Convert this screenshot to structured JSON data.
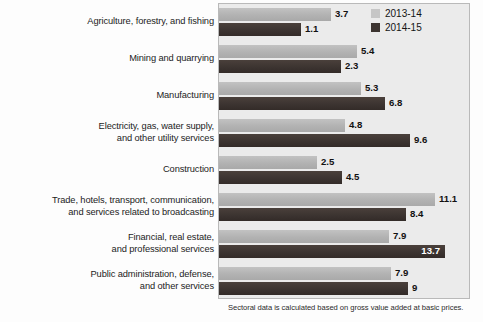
{
  "chart_data": {
    "type": "bar",
    "title": "",
    "subtitle": "",
    "xlabel": "",
    "ylabel": "",
    "orientation": "horizontal",
    "grid": false,
    "legend_position": "top-right",
    "xlim": [
      0,
      14
    ],
    "categories": [
      "Agriculture, forestry, and fishing",
      "Mining and quarrying",
      "Manufacturing",
      "Electricity, gas, water supply,\nand other utility services",
      "Construction",
      "Trade, hotels, transport, communication,\nand services related to broadcasting",
      "Financial, real estate,\nand professional services",
      "Public administration, defense,\nand other services"
    ],
    "series": [
      {
        "name": "2013-14",
        "color": "#b7b7b7",
        "values": [
          3.7,
          5.4,
          5.3,
          4.8,
          2.5,
          11.1,
          7.9,
          7.9
        ],
        "labels": [
          "3.7",
          "5.4",
          "5.3",
          "4.8",
          "2.5",
          "11.1",
          "7.9",
          "7.9"
        ],
        "bar_px": [
          112,
          138,
          142,
          126,
          98,
          216,
          170,
          172
        ],
        "label_inside": [
          false,
          false,
          false,
          false,
          false,
          false,
          false,
          false
        ]
      },
      {
        "name": "2014-15",
        "color": "#3f3632",
        "values": [
          1.1,
          2.3,
          6.8,
          9.6,
          4.5,
          8.4,
          13.7,
          9.0
        ],
        "labels": [
          "1.1",
          "2.3",
          "6.8",
          "9.6",
          "4.5",
          "8.4",
          "13.7",
          "9"
        ],
        "bar_px": [
          82,
          122,
          166,
          191,
          123,
          187,
          226,
          189
        ],
        "label_inside": [
          false,
          false,
          false,
          false,
          false,
          false,
          true,
          false
        ]
      }
    ],
    "annotations": [
      "Sectoral data is calculated based on gross value added at basic prices."
    ]
  },
  "legend": {
    "items": [
      {
        "label": "2013-14",
        "swatch": "s1"
      },
      {
        "label": "2014-15",
        "swatch": "s2"
      }
    ]
  },
  "footnote": {
    "text": "Sectoral data is calculated based on gross value added at basic prices."
  },
  "rows": [
    {
      "label_lines": [
        "Agriculture, forestry, and fishing"
      ],
      "s1": {
        "label": "3.7",
        "px": 112,
        "inside": false
      },
      "s2": {
        "label": "1.1",
        "px": 82,
        "inside": false
      }
    },
    {
      "label_lines": [
        "Mining and quarrying"
      ],
      "s1": {
        "label": "5.4",
        "px": 138,
        "inside": false
      },
      "s2": {
        "label": "2.3",
        "px": 122,
        "inside": false
      }
    },
    {
      "label_lines": [
        "Manufacturing"
      ],
      "s1": {
        "label": "5.3",
        "px": 142,
        "inside": false
      },
      "s2": {
        "label": "6.8",
        "px": 166,
        "inside": false
      }
    },
    {
      "label_lines": [
        "Electricity, gas, water supply,",
        "and other utility services"
      ],
      "s1": {
        "label": "4.8",
        "px": 126,
        "inside": false
      },
      "s2": {
        "label": "9.6",
        "px": 191,
        "inside": false
      }
    },
    {
      "label_lines": [
        "Construction"
      ],
      "s1": {
        "label": "2.5",
        "px": 98,
        "inside": false
      },
      "s2": {
        "label": "4.5",
        "px": 123,
        "inside": false
      }
    },
    {
      "label_lines": [
        "Trade, hotels, transport, communication,",
        "and services related to broadcasting"
      ],
      "s1": {
        "label": "11.1",
        "px": 216,
        "inside": false
      },
      "s2": {
        "label": "8.4",
        "px": 187,
        "inside": false
      }
    },
    {
      "label_lines": [
        "Financial, real estate,",
        "and professional services"
      ],
      "s1": {
        "label": "7.9",
        "px": 170,
        "inside": false
      },
      "s2": {
        "label": "13.7",
        "px": 226,
        "inside": true
      }
    },
    {
      "label_lines": [
        "Public administration, defense,",
        "and other services"
      ],
      "s1": {
        "label": "7.9",
        "px": 172,
        "inside": false
      },
      "s2": {
        "label": "9",
        "px": 189,
        "inside": false
      }
    }
  ]
}
